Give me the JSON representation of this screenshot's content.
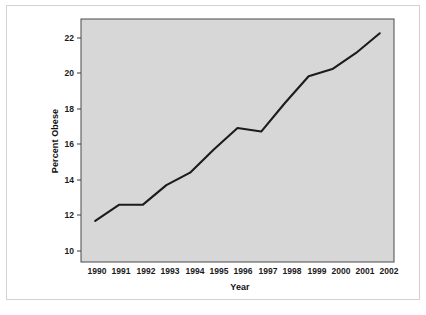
{
  "figure": {
    "background_color": "#ffffff",
    "frame_border_color": "#d2d2d2",
    "plot_background_color": "#d7d7d7",
    "line_color": "#1c1c1c",
    "axis_color": "#4a4a4a"
  },
  "chart_data": {
    "type": "line",
    "title": "",
    "xlabel": "Year",
    "ylabel": "Percent Obese",
    "categories": [
      "1990",
      "1991",
      "1992",
      "1993",
      "1994",
      "1995",
      "1996",
      "1997",
      "1998",
      "1999",
      "2000",
      "2001",
      "2002"
    ],
    "x": [
      1990,
      1991,
      1992,
      1993,
      1994,
      1995,
      1996,
      1997,
      1998,
      1999,
      2000,
      2001,
      2002
    ],
    "values": [
      11.6,
      12.5,
      12.5,
      13.6,
      14.3,
      15.6,
      16.8,
      16.6,
      18.2,
      19.7,
      20.1,
      21.0,
      22.1
    ],
    "series": [
      {
        "name": "Percent Obese",
        "values": [
          11.6,
          12.5,
          12.5,
          13.6,
          14.3,
          15.6,
          16.8,
          16.6,
          18.2,
          19.7,
          20.1,
          21.0,
          22.1
        ]
      }
    ],
    "xlim": [
      1989.4,
      2002.6
    ],
    "ylim": [
      9.3,
      22.9
    ],
    "ytick_labels": [
      "10",
      "12",
      "14",
      "16",
      "18",
      "20",
      "22"
    ],
    "yticks": [
      10,
      12,
      14,
      16,
      18,
      20,
      22
    ],
    "xtick_labels": [
      "1990",
      "1991",
      "1992",
      "1993",
      "1994",
      "1995",
      "1996",
      "1997",
      "1998",
      "1999",
      "2000",
      "2001",
      "2002"
    ],
    "grid": false,
    "legend": null,
    "legend_position": "none",
    "annotations": []
  }
}
